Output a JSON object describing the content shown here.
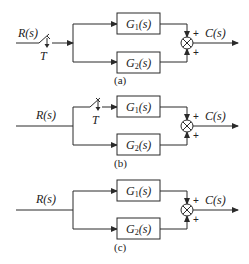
{
  "diagram": {
    "panels": [
      {
        "id": "a",
        "caption": "(a)",
        "input_label": "R(s)",
        "output_label": "C(s)",
        "switch_label": "T",
        "switch_position": "input",
        "blocks": [
          {
            "name": "G",
            "sub": "1",
            "arg": "(s)"
          },
          {
            "name": "G",
            "sub": "2",
            "arg": "(s)"
          }
        ],
        "sum_signs": [
          "+",
          "+"
        ]
      },
      {
        "id": "b",
        "caption": "(b)",
        "input_label": "R(s)",
        "output_label": "C(s)",
        "switch_label": "T",
        "switch_position": "upper-branch",
        "blocks": [
          {
            "name": "G",
            "sub": "1",
            "arg": "(s)"
          },
          {
            "name": "G",
            "sub": "2",
            "arg": "(s)"
          }
        ],
        "sum_signs": [
          "+",
          "+"
        ]
      },
      {
        "id": "c",
        "caption": "(c)",
        "input_label": "R(s)",
        "output_label": "C(s)",
        "switch_label": "",
        "switch_position": "none",
        "blocks": [
          {
            "name": "G",
            "sub": "1",
            "arg": "(s)"
          },
          {
            "name": "G",
            "sub": "2",
            "arg": "(s)"
          }
        ],
        "sum_signs": [
          "+",
          "+"
        ]
      }
    ]
  }
}
